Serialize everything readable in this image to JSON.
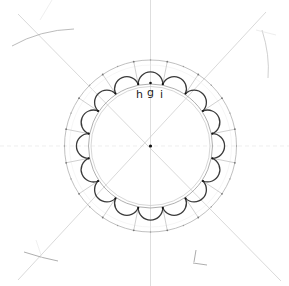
{
  "diagram": {
    "center": {
      "x": 150.5,
      "y": 146
    },
    "outer_radius": 86,
    "scallop_base_radius": 56,
    "scallop_count": 16,
    "labels": {
      "h": "h",
      "g": "g",
      "i": "i"
    },
    "colors": {
      "background": "#ffffff",
      "construction_line": "#c8c8c8",
      "guide_line": "#b0b0b0",
      "ink": "#3a3a3a",
      "point": "#111111"
    }
  }
}
